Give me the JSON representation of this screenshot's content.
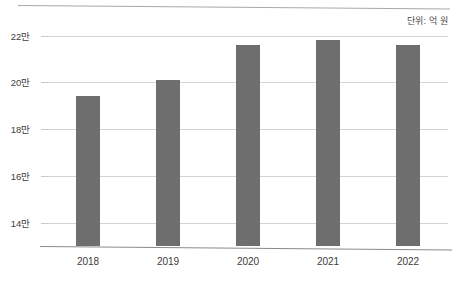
{
  "chart_data": {
    "type": "bar",
    "title": "",
    "subtitle": "",
    "annotation": "단위: 억 원",
    "xlabel": "",
    "ylabel": "",
    "categories": [
      "2018",
      "2019",
      "2020",
      "2021",
      "2022"
    ],
    "values": [
      194000,
      201000,
      216000,
      218000,
      216000
    ],
    "value_unit": "억 원",
    "ylim": [
      130000,
      225000
    ],
    "yticks": [
      140000,
      160000,
      180000,
      200000,
      220000
    ],
    "ytick_labels": [
      "14만",
      "16만",
      "18만",
      "20만",
      "22만"
    ],
    "grid": true,
    "legend": "none",
    "series": [
      {
        "name": "",
        "values": [
          194000,
          201000,
          216000,
          218000,
          216000
        ]
      }
    ],
    "colors": {
      "bar": "#6e6e6e",
      "gridline": "#d4d4d4",
      "axis": "#8a8a8a",
      "text": "#3c3c3c",
      "background": "#ffffff"
    }
  }
}
